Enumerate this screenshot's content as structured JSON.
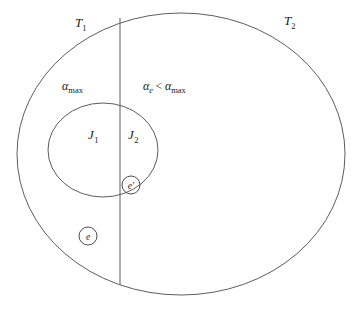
{
  "diagram": {
    "canvas": {
      "width": 361,
      "height": 310,
      "background": "#ffffff"
    },
    "stroke_color": "#5d5d5d",
    "text_color": "#1a1a1a",
    "outer_region": {
      "name": "outer-ellipse",
      "label_left": "T",
      "label_left_sub": "1",
      "label_right": "T",
      "label_right_sub": "2",
      "cx": 181,
      "cy": 154,
      "rx": 164,
      "ry": 141
    },
    "inner_region": {
      "name": "inner-ellipse",
      "label_left": "J",
      "label_left_sub": "1",
      "label_right": "J",
      "label_right_sub": "2",
      "cx": 103,
      "cy": 150,
      "rx": 55,
      "ry": 47
    },
    "divider": {
      "x": 120,
      "y_top": 18,
      "y_bottom": 285
    },
    "annotations": {
      "left_alpha": {
        "symbol": "α",
        "subscript": "max",
        "full": "αmax",
        "x": 72,
        "y": 90
      },
      "right_alpha": {
        "symbol_a": "α",
        "subscript_a": "e",
        "operator": "<",
        "symbol_b": "α",
        "subscript_b": "max",
        "full": "αe < αmax",
        "x": 143,
        "y": 90
      }
    },
    "markers": [
      {
        "name": "element-e-prime",
        "label": "e′",
        "cx": 131,
        "cy": 185,
        "r": 9
      },
      {
        "name": "element-e",
        "label": "e",
        "cx": 88,
        "cy": 236,
        "r": 9
      }
    ],
    "labels": {
      "t1": {
        "x": 75,
        "y": 27
      },
      "t2": {
        "x": 284,
        "y": 25
      },
      "j1": {
        "x": 92,
        "y": 139
      },
      "j2": {
        "x": 132,
        "y": 139
      }
    }
  }
}
